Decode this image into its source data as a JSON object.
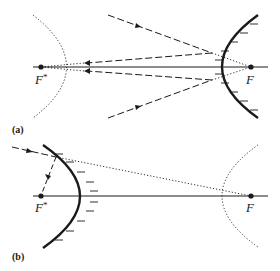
{
  "figure": {
    "panel_a": {
      "label": "(a)",
      "focus_virtual": {
        "label": "F",
        "superscript": "*"
      },
      "focus_real": {
        "label": "F"
      },
      "mirror": "convex hyperbolic mirror (solid, hatched)",
      "virtual_branch": "dotted hyperbola branch around F*",
      "rays": "incoming dashed rays toward F, reflected toward F*"
    },
    "panel_b": {
      "label": "(b)",
      "focus_virtual": {
        "label": "F",
        "superscript": "*"
      },
      "focus_real": {
        "label": "F"
      },
      "mirror": "concave-side hyperbolic mirror (solid, hatched)",
      "virtual_branch": "dotted hyperbola branch around F",
      "rays": "incoming dashed ray aimed at F, reflected to F*"
    }
  },
  "colors": {
    "ink": "#1a1a1a",
    "background": "#ffffff"
  }
}
